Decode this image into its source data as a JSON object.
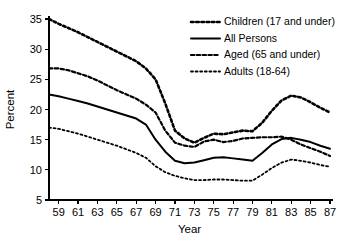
{
  "chart_data": {
    "type": "line",
    "title": "",
    "xlabel": "Year",
    "ylabel": "Percent",
    "xlim": [
      58,
      87
    ],
    "ylim": [
      5,
      35
    ],
    "grid": false,
    "legend_position": "top-right",
    "x_ticks": [
      59,
      61,
      63,
      65,
      67,
      69,
      71,
      73,
      75,
      77,
      79,
      81,
      83,
      85,
      87
    ],
    "y_ticks": [
      5,
      10,
      15,
      20,
      25,
      30,
      35
    ],
    "x": [
      58,
      59,
      60,
      61,
      62,
      63,
      64,
      65,
      66,
      67,
      68,
      69,
      70,
      71,
      72,
      73,
      74,
      75,
      76,
      77,
      78,
      79,
      80,
      81,
      82,
      83,
      84,
      85,
      86,
      87
    ],
    "series": [
      {
        "name": "Children (17 and under)",
        "style": "dotted-thick",
        "values": [
          35.0,
          34.2,
          33.5,
          32.8,
          32.0,
          31.2,
          30.4,
          29.6,
          28.8,
          28.0,
          26.8,
          25.0,
          21.0,
          16.5,
          15.2,
          14.5,
          15.3,
          16.0,
          15.9,
          16.2,
          16.5,
          16.4,
          17.8,
          19.8,
          21.5,
          22.3,
          22.0,
          21.2,
          20.3,
          19.5
        ]
      },
      {
        "name": "All Persons",
        "style": "solid",
        "values": [
          22.5,
          22.2,
          21.8,
          21.4,
          21.0,
          20.5,
          20.0,
          19.5,
          19.0,
          18.5,
          17.5,
          15.0,
          13.0,
          11.5,
          11.1,
          11.2,
          11.6,
          12.0,
          12.1,
          11.9,
          11.7,
          11.5,
          12.8,
          14.2,
          15.1,
          15.3,
          15.0,
          14.6,
          14.0,
          13.5
        ]
      },
      {
        "name": "Aged (65 and under)",
        "style": "dashed",
        "values": [
          26.8,
          26.8,
          26.5,
          26.0,
          25.5,
          24.8,
          24.0,
          23.2,
          22.5,
          21.8,
          20.8,
          19.5,
          16.5,
          14.5,
          14.0,
          13.8,
          14.7,
          15.0,
          14.6,
          14.8,
          15.2,
          15.3,
          15.4,
          15.4,
          15.5,
          15.0,
          14.2,
          13.6,
          13.0,
          12.3
        ]
      },
      {
        "name": "Adults (18-64)",
        "style": "dotted-fine",
        "values": [
          17.0,
          16.8,
          16.4,
          16.0,
          15.5,
          15.0,
          14.5,
          14.0,
          13.4,
          12.8,
          12.0,
          10.6,
          9.6,
          9.0,
          8.6,
          8.3,
          8.3,
          8.4,
          8.4,
          8.3,
          8.2,
          8.2,
          9.2,
          10.3,
          11.2,
          11.7,
          11.5,
          11.2,
          10.8,
          10.5
        ]
      }
    ],
    "legend": [
      {
        "label": "Children (17 and under)",
        "style": "dotted-thick"
      },
      {
        "label": "All Persons",
        "style": "solid"
      },
      {
        "label": "Aged (65 and under)",
        "style": "dashed"
      },
      {
        "label": "Adults (18-64)",
        "style": "dotted-fine"
      }
    ]
  }
}
